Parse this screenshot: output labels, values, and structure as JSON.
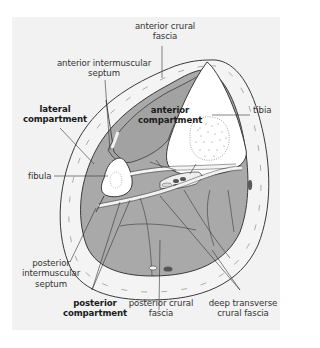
{
  "figure": {
    "colors": {
      "background": "#ffffff",
      "panel": "#f2f2f2",
      "muscle": "#a9a9a9",
      "bone": "#ffffff",
      "fascia_band": "#f2f2f2",
      "outline": "#3a3a3a",
      "vessel_dark": "#555555",
      "text": "#333333"
    }
  },
  "labels": {
    "anterior_crural_fascia": {
      "line1": "anterior crural",
      "line2": "fascia",
      "bold": false
    },
    "anterior_intermuscular_septum": {
      "line1": "anterior intermuscular",
      "line2": "septum",
      "bold": false
    },
    "tibia": {
      "line1": "tibia",
      "bold": false
    },
    "lateral_compartment": {
      "line1": "lateral",
      "line2": "compartment",
      "bold": true
    },
    "anterior_compartment": {
      "line1": "anterior",
      "line2": "compartment",
      "bold": true
    },
    "fibula": {
      "line1": "fibula",
      "bold": false
    },
    "posterior_intermuscular_septum": {
      "line1": "posterior",
      "line2": "intermuscular",
      "line3": "septum",
      "bold": false
    },
    "posterior_compartment": {
      "line1": "posterior",
      "line2": "compartment",
      "bold": true
    },
    "posterior_crural_fascia": {
      "line1": "posterior crural",
      "line2": "fascia",
      "bold": false
    },
    "deep_transverse_crural_fascia": {
      "line1": "deep transverse",
      "line2": "crural fascia",
      "bold": false
    }
  }
}
